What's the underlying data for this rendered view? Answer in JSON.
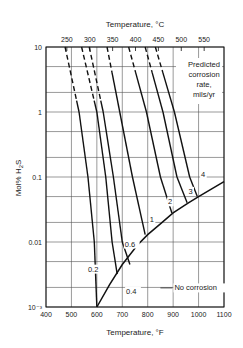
{
  "chart_data": {
    "type": "line",
    "title": "",
    "xlabel": "Temperature, °F",
    "x2label": "Temperature, °C",
    "ylabel": "Mol% H2S",
    "xlim": [
      400,
      1100
    ],
    "ylim": [
      0.001,
      10
    ],
    "yscale": "log",
    "grid": true,
    "x_ticks": [
      "400",
      "500",
      "600",
      "700",
      "800",
      "900",
      "1000",
      "1100"
    ],
    "x_tick_values": [
      400,
      500,
      600,
      700,
      800,
      900,
      1000,
      1100
    ],
    "x2_ticks": [
      "250",
      "300",
      "350",
      "400",
      "450",
      "500",
      "550"
    ],
    "x2_tick_values_C": [
      250,
      300,
      350,
      400,
      450,
      500,
      550
    ],
    "y_ticks": [
      "10",
      "1",
      "0.1",
      "0.01",
      "10⁻³"
    ],
    "y_tick_values": [
      10,
      1,
      0.1,
      0.01,
      0.001
    ],
    "y_minor_grid": [
      5,
      2,
      0.5,
      0.2,
      0.05,
      0.02,
      0.005,
      0.002
    ],
    "annotation": [
      "Predicted",
      "corrosion",
      "rate,",
      "mils/yr"
    ],
    "boundary": {
      "name": "No corrosion",
      "points": [
        [
          600,
          0.001
        ],
        [
          650,
          0.0022
        ],
        [
          700,
          0.0045
        ],
        [
          760,
          0.009
        ],
        [
          800,
          0.013
        ],
        [
          850,
          0.019
        ],
        [
          900,
          0.028
        ],
        [
          960,
          0.04
        ],
        [
          1000,
          0.05
        ],
        [
          1050,
          0.065
        ],
        [
          1100,
          0.085
        ]
      ]
    },
    "series": [
      {
        "name": "0.2",
        "values": [
          [
            475,
            10
          ],
          [
            530,
            1
          ],
          [
            565,
            0.1
          ],
          [
            590,
            0.01
          ],
          [
            600,
            0.001
          ]
        ],
        "dashed_above": 1.5
      },
      {
        "name": "0.4",
        "values": [
          [
            540,
            10
          ],
          [
            600,
            1
          ],
          [
            635,
            0.1
          ],
          [
            660,
            0.01
          ],
          [
            680,
            0.0032
          ]
        ],
        "dashed_above": 1.5
      },
      {
        "name": "0.6",
        "values": [
          [
            570,
            10
          ],
          [
            625,
            1
          ],
          [
            665,
            0.1
          ],
          [
            700,
            0.01
          ],
          [
            730,
            0.0045
          ]
        ],
        "dashed_above": 1.5
      },
      {
        "name": "1",
        "values": [
          [
            640,
            10
          ],
          [
            690,
            1
          ],
          [
            740,
            0.1
          ],
          [
            790,
            0.013
          ]
        ],
        "dashed_above": 4
      },
      {
        "name": "2",
        "values": [
          [
            725,
            10
          ],
          [
            795,
            1
          ],
          [
            850,
            0.1
          ],
          [
            895,
            0.028
          ]
        ],
        "dashed_above": 4
      },
      {
        "name": "3",
        "values": [
          [
            790,
            10
          ],
          [
            860,
            1
          ],
          [
            915,
            0.1
          ],
          [
            955,
            0.04
          ]
        ],
        "dashed_above": 4
      },
      {
        "name": "4",
        "values": [
          [
            830,
            10
          ],
          [
            905,
            1
          ],
          [
            965,
            0.1
          ],
          [
            995,
            0.05
          ]
        ],
        "dashed_above": 4
      }
    ],
    "series_label_positions": [
      {
        "name": "0.2",
        "F": 565,
        "mol": 0.0035
      },
      {
        "name": "0.4",
        "F": 715,
        "mol": 0.0016
      },
      {
        "name": "0.6",
        "F": 710,
        "mol": 0.0085
      },
      {
        "name": "1",
        "F": 808,
        "mol": 0.02
      },
      {
        "name": "2",
        "F": 880,
        "mol": 0.038
      },
      {
        "name": "3",
        "F": 960,
        "mol": 0.055
      },
      {
        "name": "4",
        "F": 1010,
        "mol": 0.1
      },
      {
        "name": "No corrosion",
        "F": 905,
        "mol": 0.0018
      }
    ]
  }
}
